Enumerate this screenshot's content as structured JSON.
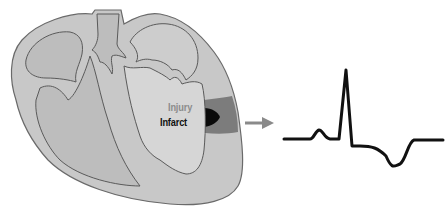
{
  "diagram": {
    "labels": {
      "injury": "Injury",
      "infarct": "Infarct"
    },
    "colors": {
      "heart_wall": "#c9c9c9",
      "chamber": "#bdbdbd",
      "outline": "#6e6e6e",
      "injury_zone": "#7a7a7a",
      "infarct_zone": "#0a0a0a",
      "arrow": "#8a8a8a",
      "ecg_trace": "#111111"
    },
    "arrow": {
      "direction": "right",
      "meaning": "leads-to"
    },
    "ecg": {
      "waves": [
        "P wave",
        "QRS complex (tall R)",
        "ST segment",
        "inverted T wave"
      ]
    }
  }
}
